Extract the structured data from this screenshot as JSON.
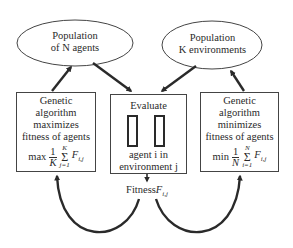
{
  "diagram": {
    "nodes": {
      "agents_population": {
        "line1": "Population",
        "line2": "of N agents"
      },
      "env_population": {
        "line1": "Population",
        "line2": "K environments"
      },
      "ga_agents": {
        "line1": "Genetic",
        "line2": "algorithm",
        "line3": "maximizes",
        "line4": "fitness of agents",
        "formula": {
          "op": "max",
          "num": "1",
          "den": "K",
          "sum_top": "K",
          "sum_bottom": "j=1",
          "term": "F",
          "sub": "i,j"
        }
      },
      "evaluate": {
        "title": "Evaluate",
        "line1": "agent i in",
        "line2": "environment j"
      },
      "ga_envs": {
        "line1": "Genetic",
        "line2": "algorithm",
        "line3": "minimizes",
        "line4": "fitness of agents",
        "formula": {
          "op": "min",
          "num": "1",
          "den": "N",
          "sum_top": "N",
          "sum_bottom": "i=1",
          "term": "F",
          "sub": "i,j"
        }
      },
      "fitness": {
        "label": "Fitness",
        "term": "F",
        "sub": "i,j"
      }
    },
    "colors": {
      "stroke": "#2a2a2a",
      "background": "#ffffff"
    }
  }
}
